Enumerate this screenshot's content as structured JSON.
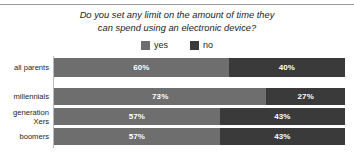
{
  "chart_data": {
    "type": "bar",
    "subtype": "stacked-horizontal-100",
    "title": "Do you set any limit on the amount of time they can spend using an electronic device?",
    "title_lines": [
      "Do you set any limit on the amount of time they",
      "can spend using an electronic device?"
    ],
    "xlabel": "",
    "ylabel": "",
    "xlim": [
      0,
      100
    ],
    "grid": false,
    "legend_position": "top-center",
    "categories": [
      "all parents",
      "millennials",
      "generation Xers",
      "boomers"
    ],
    "category_label_lines": [
      [
        "all parents"
      ],
      [
        "millennials"
      ],
      [
        "generation",
        "Xers"
      ],
      [
        "boomers"
      ]
    ],
    "series": [
      {
        "name": "yes",
        "color": "#6e6e6e",
        "values": [
          60,
          73,
          57,
          57
        ],
        "labels": [
          "60%",
          "73%",
          "57%",
          "57%"
        ]
      },
      {
        "name": "no",
        "color": "#3a3a3a",
        "values": [
          40,
          27,
          43,
          43
        ],
        "labels": [
          "40%",
          "27%",
          "43%",
          "43%"
        ]
      }
    ]
  },
  "legend": {
    "entries": [
      {
        "label": "yes",
        "color": "#6e6e6e"
      },
      {
        "label": "no",
        "color": "#3a3a3a"
      }
    ]
  },
  "colors": {
    "yes": "#6e6e6e",
    "no": "#3a3a3a",
    "axis": "#b9b9b9",
    "rule": "#9a9a9a",
    "text": "#1c1c1c",
    "background": "#ffffff"
  },
  "layout": {
    "bar_tops": [
      2,
      32,
      52,
      72
    ],
    "bar_height": 18,
    "bar_heights": [
      19,
      17,
      17,
      17
    ]
  }
}
